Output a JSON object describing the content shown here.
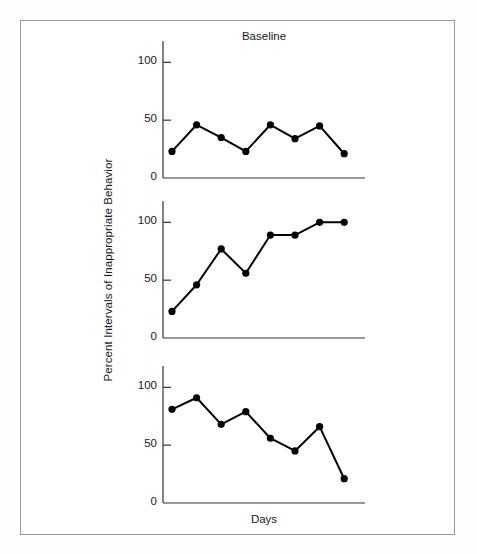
{
  "figure": {
    "ylabel": "Percent Intervals of Inappropriate Behavior",
    "xlabel": "Days",
    "border_color": "#9a9a9a",
    "line_color": "#000000",
    "marker_color": "#000000"
  },
  "chart_data": {
    "type": "line",
    "title": "Baseline",
    "xlabel": "Days",
    "ylabel": "Percent Intervals of Inappropriate Behavior",
    "ylim": [
      0,
      115
    ],
    "xlim": [
      0,
      9
    ],
    "grid": false,
    "legend": false,
    "yticks": [
      0,
      50,
      100
    ],
    "ytick_labels": [
      "0",
      "50",
      "100"
    ],
    "xticks": [],
    "xtick_labels": [],
    "panels": [
      {
        "title": "Baseline",
        "x": [
          1,
          2,
          3,
          4,
          5,
          6,
          7,
          8
        ],
        "values": [
          23,
          46,
          35,
          23,
          46,
          34,
          45,
          21
        ]
      },
      {
        "title": "",
        "x": [
          1,
          2,
          3,
          4,
          5,
          6,
          7,
          8
        ],
        "values": [
          23,
          46,
          77,
          56,
          89,
          89,
          100,
          100
        ]
      },
      {
        "title": "",
        "x": [
          1,
          2,
          3,
          4,
          5,
          6,
          7,
          8
        ],
        "values": [
          81,
          91,
          68,
          79,
          56,
          45,
          66,
          21
        ]
      }
    ]
  }
}
